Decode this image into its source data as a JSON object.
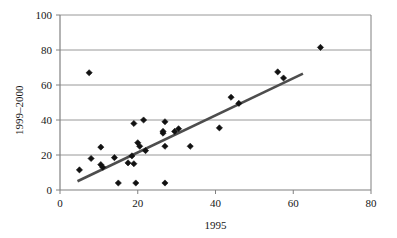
{
  "chart_data": {
    "type": "scatter",
    "title": "",
    "xlabel": "1995",
    "ylabel": "1999–2000",
    "xlim": [
      0,
      80
    ],
    "ylim": [
      0,
      100
    ],
    "xticks": [
      0,
      20,
      40,
      60,
      80
    ],
    "yticks": [
      0,
      20,
      40,
      60,
      80,
      100
    ],
    "xtick_labels": [
      "0",
      "20",
      "40",
      "60",
      "80"
    ],
    "ytick_labels": [
      "0",
      "20",
      "40",
      "60",
      "80",
      "100"
    ],
    "grid": "horizontal",
    "legend": "none",
    "marker": "diamond",
    "marker_color": "#111111",
    "points": [
      {
        "x": 5.0,
        "y": 11.5
      },
      {
        "x": 7.5,
        "y": 67.0
      },
      {
        "x": 8.0,
        "y": 18.0
      },
      {
        "x": 10.5,
        "y": 24.5
      },
      {
        "x": 10.5,
        "y": 14.5
      },
      {
        "x": 11.0,
        "y": 13.0
      },
      {
        "x": 14.0,
        "y": 18.5
      },
      {
        "x": 15.0,
        "y": 4.0
      },
      {
        "x": 17.5,
        "y": 15.5
      },
      {
        "x": 18.5,
        "y": 19.5
      },
      {
        "x": 19.0,
        "y": 38.0
      },
      {
        "x": 19.0,
        "y": 15.0
      },
      {
        "x": 19.5,
        "y": 4.0
      },
      {
        "x": 20.0,
        "y": 27.0
      },
      {
        "x": 20.5,
        "y": 25.0
      },
      {
        "x": 21.5,
        "y": 40.0
      },
      {
        "x": 22.0,
        "y": 22.5
      },
      {
        "x": 26.5,
        "y": 33.5
      },
      {
        "x": 26.5,
        "y": 32.5
      },
      {
        "x": 27.0,
        "y": 39.0
      },
      {
        "x": 27.0,
        "y": 25.0
      },
      {
        "x": 27.0,
        "y": 4.0
      },
      {
        "x": 29.5,
        "y": 33.5
      },
      {
        "x": 30.5,
        "y": 35.0
      },
      {
        "x": 33.5,
        "y": 25.0
      },
      {
        "x": 41.0,
        "y": 35.5
      },
      {
        "x": 44.0,
        "y": 53.0
      },
      {
        "x": 46.0,
        "y": 49.5
      },
      {
        "x": 56.0,
        "y": 67.5
      },
      {
        "x": 57.5,
        "y": 64.0
      },
      {
        "x": 67.0,
        "y": 81.5
      }
    ],
    "trendline": {
      "x_start": 4.5,
      "y_start": 5.0,
      "x_end": 62.5,
      "y_end": 66.5,
      "color": "#4d4d4d",
      "width": 2.6
    },
    "axis_color": "#808080",
    "grid_color": "#8c8c8c"
  }
}
